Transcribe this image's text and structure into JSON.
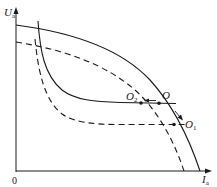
{
  "diagram": {
    "axes": {
      "y_label_main": "U",
      "y_label_sub": "a",
      "x_label_main": "I",
      "x_label_sub": "a",
      "origin": "0"
    },
    "points": {
      "O": {
        "label": "O",
        "sub": ""
      },
      "O1": {
        "label": "O",
        "sub": "1"
      },
      "O2": {
        "label": "O",
        "sub": "2"
      }
    },
    "curves": [
      {
        "name": "source-characteristic-solid",
        "style": "solid"
      },
      {
        "name": "source-characteristic-dashed",
        "style": "dashed"
      },
      {
        "name": "arc-characteristic-solid",
        "style": "solid"
      },
      {
        "name": "arc-characteristic-dashed",
        "style": "dashed"
      }
    ],
    "colors": {
      "line": "#1a1a1a",
      "background": "#ffffff"
    }
  }
}
